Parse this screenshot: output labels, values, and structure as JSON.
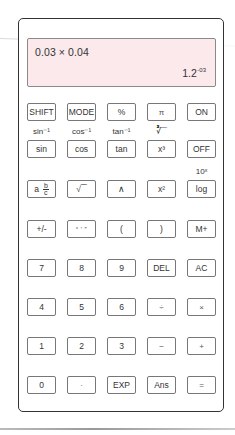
{
  "display": {
    "expression": "0.03 × 0.04",
    "result_mantissa": "1.2",
    "result_exponent": "-03",
    "background": "#fbe9ec"
  },
  "rows": [
    {
      "keys": [
        {
          "label": "SHIFT",
          "name": "shift"
        },
        {
          "label": "MODE",
          "name": "mode"
        },
        {
          "label": "%",
          "name": "percent"
        },
        {
          "label": "π",
          "name": "pi"
        },
        {
          "label": "ON",
          "name": "on"
        }
      ]
    },
    {
      "secondary": [
        "sin⁻¹",
        "cos⁻¹",
        "tan⁻¹",
        "∛‾‾",
        ""
      ],
      "keys": [
        {
          "label": "sin",
          "name": "sin"
        },
        {
          "label": "cos",
          "name": "cos"
        },
        {
          "label": "tan",
          "name": "tan"
        },
        {
          "label": "x³",
          "name": "cube"
        },
        {
          "label": "OFF",
          "name": "off"
        }
      ]
    },
    {
      "secondary": [
        "",
        "",
        "",
        "",
        "10ˣ"
      ],
      "keys": [
        {
          "label": "a b/c",
          "name": "fraction"
        },
        {
          "label": "√‾‾",
          "name": "sqrt"
        },
        {
          "label": "∧",
          "name": "power"
        },
        {
          "label": "x²",
          "name": "square"
        },
        {
          "label": "log",
          "name": "log"
        }
      ]
    },
    {
      "keys": [
        {
          "label": "+/-",
          "name": "negate"
        },
        {
          "label": "° ′ ″",
          "name": "degrees"
        },
        {
          "label": "(",
          "name": "open-paren"
        },
        {
          "label": ")",
          "name": "close-paren"
        },
        {
          "label": "M+",
          "name": "memory-add"
        }
      ]
    },
    {
      "keys": [
        {
          "label": "7",
          "name": "7"
        },
        {
          "label": "8",
          "name": "8"
        },
        {
          "label": "9",
          "name": "9"
        },
        {
          "label": "DEL",
          "name": "delete"
        },
        {
          "label": "AC",
          "name": "all-clear"
        }
      ]
    },
    {
      "keys": [
        {
          "label": "4",
          "name": "4"
        },
        {
          "label": "5",
          "name": "5"
        },
        {
          "label": "6",
          "name": "6"
        },
        {
          "label": "÷",
          "name": "divide"
        },
        {
          "label": "×",
          "name": "multiply"
        }
      ]
    },
    {
      "keys": [
        {
          "label": "1",
          "name": "1"
        },
        {
          "label": "2",
          "name": "2"
        },
        {
          "label": "3",
          "name": "3"
        },
        {
          "label": "−",
          "name": "subtract"
        },
        {
          "label": "+",
          "name": "add"
        }
      ]
    },
    {
      "keys": [
        {
          "label": "0",
          "name": "0"
        },
        {
          "label": "·",
          "name": "decimal"
        },
        {
          "label": "EXP",
          "name": "exp"
        },
        {
          "label": "Ans",
          "name": "answer"
        },
        {
          "label": "=",
          "name": "equals"
        }
      ]
    }
  ]
}
